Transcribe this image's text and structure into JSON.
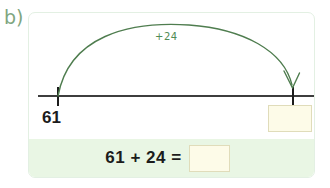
{
  "part": {
    "label": "b)"
  },
  "numberline": {
    "start_value": "61",
    "jump_label": "+24",
    "end_value": "",
    "end_placeholder": "",
    "line_color": "#3d3d3d",
    "arc_color": "#4f7d4f",
    "tick_color": "#1c1c1c"
  },
  "equation": {
    "expression": "61 + 24 =",
    "answer_value": "",
    "answer_placeholder": "",
    "strip_color": "#e9f6e4"
  },
  "theme": {
    "card_background": "#ffffff",
    "card_border": "#e3f0e3",
    "answer_box_fill": "#fdfbe8",
    "answer_box_border": "#e0dcba",
    "label_color": "#7fa67f",
    "accent_green": "#4f8b55"
  }
}
